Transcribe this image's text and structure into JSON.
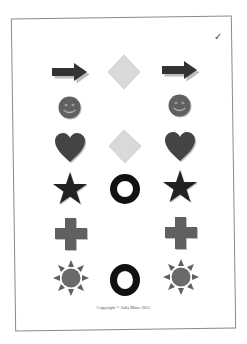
{
  "document": {
    "checkmark": "✓",
    "copyright": "Copyright © Julia Moss 2015"
  },
  "colors": {
    "dark": "#333333",
    "medium": "#606060",
    "light": "#d8d8d8",
    "black": "#111111",
    "shadow": "#bdbdbd"
  },
  "grid": {
    "columns": [
      "left",
      "middle",
      "right"
    ],
    "rows": [
      {
        "left": "arrow-right",
        "middle": "diamond",
        "right": "arrow-right"
      },
      {
        "left": "smiley",
        "middle": "",
        "right": "smiley"
      },
      {
        "left": "heart",
        "middle": "diamond",
        "right": "heart"
      },
      {
        "left": "star",
        "middle": "ring",
        "right": "star"
      },
      {
        "left": "cross",
        "middle": "",
        "right": "cross"
      },
      {
        "left": "sun",
        "middle": "ring",
        "right": "sun"
      }
    ]
  }
}
